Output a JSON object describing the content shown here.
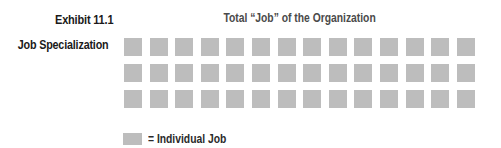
{
  "exhibit": {
    "number_label": "Exhibit 11.1",
    "title": "Job Specialization"
  },
  "diagram": {
    "header": "Total “Job” of the Organization",
    "grid": {
      "rows": 3,
      "columns": 14,
      "total_squares": 42,
      "square_color": "#bdbdbd"
    }
  },
  "legend": {
    "swatch_color": "#bdbdbd",
    "label": "= Individual Job"
  }
}
